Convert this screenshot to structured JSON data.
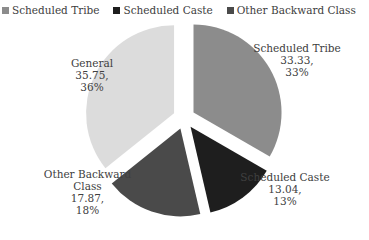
{
  "chart_data": {
    "type": "pie",
    "title": "",
    "exploded": true,
    "start_angle_deg": 0,
    "direction": "clockwise",
    "categories": [
      "Scheduled Tribe",
      "Scheduled Caste",
      "Other Backward Class",
      "General"
    ],
    "values": [
      33.33,
      13.04,
      17.87,
      35.75
    ],
    "percent_labels": [
      "33%",
      "13%",
      "18%",
      "36%"
    ],
    "value_labels": [
      "33.33,",
      "13.04,",
      "17.87,",
      "35.75,"
    ],
    "colors": [
      "#8c8c8c",
      "#1e1e1e",
      "#4a4a4a",
      "#dcdcdc"
    ],
    "legend_position": "top"
  },
  "legend": {
    "items": [
      {
        "label": "Scheduled Tribe",
        "color": "#8c8c8c"
      },
      {
        "label": "Scheduled Caste",
        "color": "#1e1e1e"
      },
      {
        "label": "Other Backward Class",
        "color": "#4a4a4a"
      },
      {
        "label": "General",
        "color": "#dcdcdc"
      }
    ]
  },
  "labels": {
    "st": {
      "name": "Scheduled Tribe",
      "value": "33.33,",
      "pct": "33%"
    },
    "sc": {
      "name": "Scheduled Caste",
      "value": "13.04,",
      "pct": "13%"
    },
    "obc": {
      "name1": "Other Backward",
      "name2": "Class",
      "value": "17.87,",
      "pct": "18%"
    },
    "gen": {
      "name": "General",
      "value": "35.75,",
      "pct": "36%"
    }
  }
}
